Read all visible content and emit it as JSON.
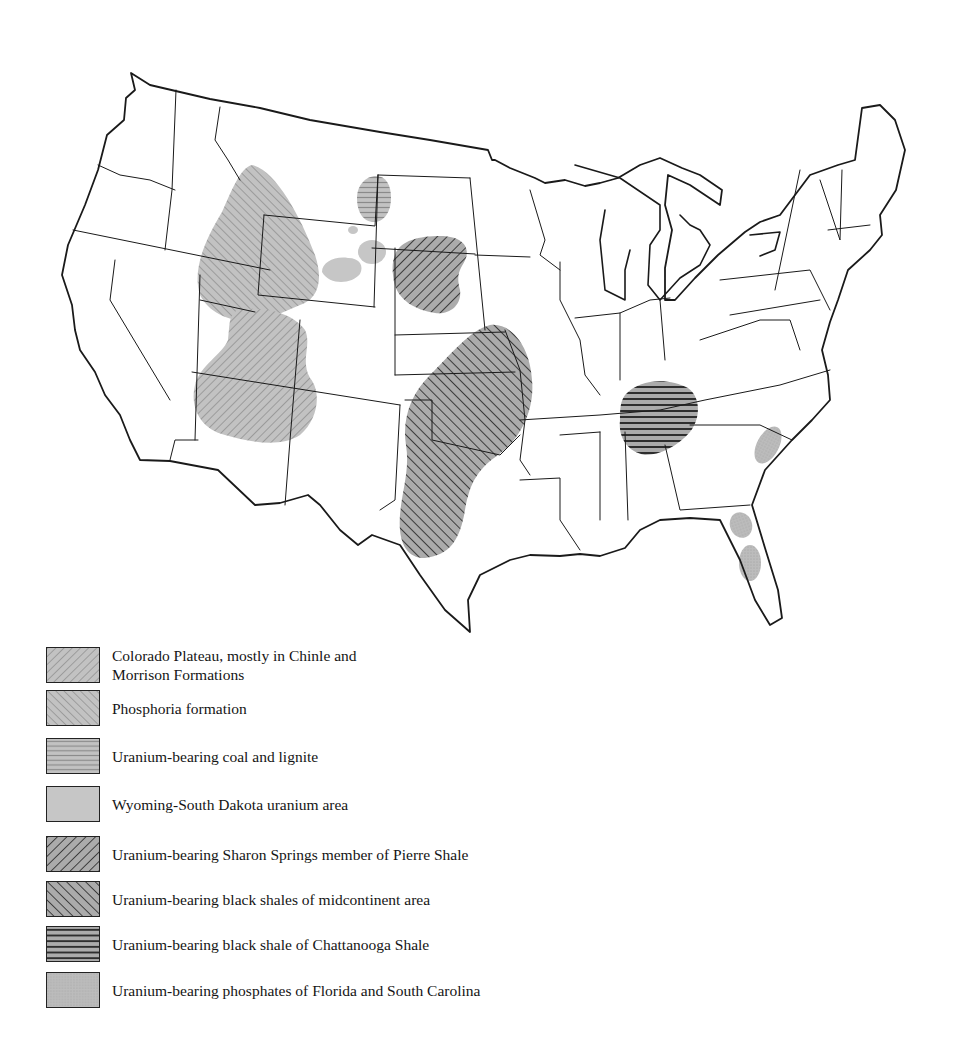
{
  "map": {
    "title": "",
    "region": "Conterminous United States",
    "background_color": "#ffffff",
    "boundary_color": "#1a1a1a",
    "areas": [
      {
        "id": "colorado-plateau",
        "legend_index": 0,
        "location": "Utah / Colorado / Arizona / New Mexico (Four Corners)",
        "pattern": "diagonal-up-fine",
        "fill": "#bdbdbd"
      },
      {
        "id": "phosphoria",
        "legend_index": 1,
        "location": "Idaho / Wyoming / Utah / Montana",
        "pattern": "diagonal-down-fine",
        "fill": "#bdbdbd"
      },
      {
        "id": "coal-lignite",
        "legend_index": 2,
        "location": "North Dakota / Montana / South Dakota border",
        "pattern": "horizontal-fine",
        "fill": "#bdbdbd"
      },
      {
        "id": "wyoming-sd",
        "legend_index": 3,
        "location": "NE Wyoming / SW South Dakota (Black Hills)",
        "pattern": "solid",
        "fill": "#c6c6c6"
      },
      {
        "id": "sharon-springs",
        "legend_index": 4,
        "location": "South Dakota / Nebraska",
        "pattern": "diagonal-up-bold",
        "fill": "#a8a8a8"
      },
      {
        "id": "midcontinent",
        "legend_index": 5,
        "location": "Kansas / Oklahoma / Texas / Missouri",
        "pattern": "diagonal-down-bold",
        "fill": "#a8a8a8"
      },
      {
        "id": "chattanooga",
        "legend_index": 6,
        "location": "Tennessee / Alabama / Georgia",
        "pattern": "horizontal-bold",
        "fill": "#a8a8a8"
      },
      {
        "id": "fl-sc-phosphates",
        "legend_index": 7,
        "location": "South Carolina coast, central Florida (2 areas)",
        "pattern": "stipple",
        "fill": "#b9b9b9"
      }
    ]
  },
  "legend": {
    "items": [
      {
        "label_line1": "Colorado Plateau, mostly in Chinle and",
        "label_line2": "Morrison Formations",
        "pattern": "diagonal-up-fine"
      },
      {
        "label_line1": "Phosphoria formation",
        "label_line2": "",
        "pattern": "diagonal-down-fine"
      },
      {
        "label_line1": "Uranium-bearing coal and lignite",
        "label_line2": "",
        "pattern": "horizontal-fine"
      },
      {
        "label_line1": "Wyoming-South Dakota uranium area",
        "label_line2": "",
        "pattern": "solid"
      },
      {
        "label_line1": "Uranium-bearing Sharon Springs member of Pierre Shale",
        "label_line2": "",
        "pattern": "diagonal-up-bold"
      },
      {
        "label_line1": "Uranium-bearing black shales of midcontinent area",
        "label_line2": "",
        "pattern": "diagonal-down-bold"
      },
      {
        "label_line1": "Uranium-bearing black shale of Chattanooga Shale",
        "label_line2": "",
        "pattern": "horizontal-bold"
      },
      {
        "label_line1": "Uranium-bearing phosphates of Florida and South Carolina",
        "label_line2": "",
        "pattern": "stipple"
      }
    ]
  }
}
